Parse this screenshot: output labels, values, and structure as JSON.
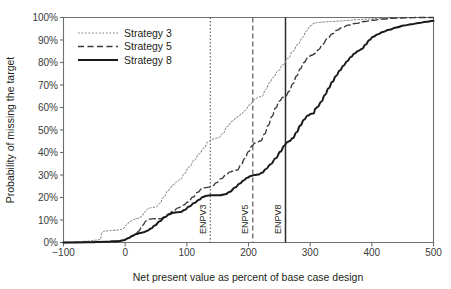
{
  "chart_data": {
    "type": "line",
    "title": "",
    "xlabel": "Net present value as percent of base case design",
    "ylabel": "Probability of missing the target",
    "xlim": [
      -100,
      500
    ],
    "ylim": [
      0,
      100
    ],
    "xticks": [
      -100,
      0,
      100,
      200,
      300,
      400,
      500
    ],
    "xtick_labels": [
      "−100",
      "0",
      "100",
      "200",
      "300",
      "400",
      "500"
    ],
    "yticks": [
      0,
      10,
      20,
      30,
      40,
      50,
      60,
      70,
      80,
      90,
      100
    ],
    "ytick_labels": [
      "0%",
      "10%",
      "20%",
      "30%",
      "40%",
      "50%",
      "60%",
      "70%",
      "80%",
      "90%",
      "100%"
    ],
    "grid": false,
    "legend_position": "top-left",
    "series": [
      {
        "name": "Strategy 3",
        "style": "dotted",
        "color": "#7a7a7a",
        "width": 1.0,
        "points": [
          [
            -100,
            0
          ],
          [
            -80,
            0.3
          ],
          [
            -60,
            0.6
          ],
          [
            -48,
            1.0
          ],
          [
            -40,
            1.3
          ],
          [
            -38,
            4.2
          ],
          [
            -34,
            5.0
          ],
          [
            -28,
            5.2
          ],
          [
            -20,
            5.4
          ],
          [
            -10,
            5.6
          ],
          [
            -4,
            6.0
          ],
          [
            2,
            7.8
          ],
          [
            8,
            9.4
          ],
          [
            14,
            10.2
          ],
          [
            20,
            10.7
          ],
          [
            26,
            11.4
          ],
          [
            32,
            13.6
          ],
          [
            38,
            15.2
          ],
          [
            44,
            15.6
          ],
          [
            50,
            15.8
          ],
          [
            56,
            17.4
          ],
          [
            62,
            20.0
          ],
          [
            70,
            23.2
          ],
          [
            78,
            25.6
          ],
          [
            84,
            27.0
          ],
          [
            90,
            28.2
          ],
          [
            96,
            30.6
          ],
          [
            104,
            33.6
          ],
          [
            112,
            36.6
          ],
          [
            120,
            39.4
          ],
          [
            128,
            42.0
          ],
          [
            134,
            44.6
          ],
          [
            140,
            45.8
          ],
          [
            146,
            46.2
          ],
          [
            152,
            46.6
          ],
          [
            158,
            48.4
          ],
          [
            166,
            51.6
          ],
          [
            174,
            54.0
          ],
          [
            182,
            55.8
          ],
          [
            188,
            57.0
          ],
          [
            194,
            58.6
          ],
          [
            202,
            61.2
          ],
          [
            210,
            63.6
          ],
          [
            216,
            64.6
          ],
          [
            222,
            65.0
          ],
          [
            228,
            68.0
          ],
          [
            234,
            71.0
          ],
          [
            240,
            73.4
          ],
          [
            248,
            76.2
          ],
          [
            256,
            79.0
          ],
          [
            264,
            81.8
          ],
          [
            272,
            85.0
          ],
          [
            280,
            88.0
          ],
          [
            288,
            91.2
          ],
          [
            294,
            94.0
          ],
          [
            300,
            96.2
          ],
          [
            306,
            97.4
          ],
          [
            312,
            97.8
          ],
          [
            322,
            98.0
          ],
          [
            334,
            98.2
          ],
          [
            346,
            98.4
          ],
          [
            360,
            98.7
          ],
          [
            376,
            99.0
          ],
          [
            392,
            99.3
          ],
          [
            410,
            99.6
          ],
          [
            430,
            99.8
          ],
          [
            450,
            100
          ],
          [
            470,
            100
          ],
          [
            500,
            100
          ]
        ]
      },
      {
        "name": "Strategy 5",
        "style": "dashed",
        "color": "#3a3a3a",
        "width": 1.4,
        "points": [
          [
            -100,
            0
          ],
          [
            -60,
            0.2
          ],
          [
            -30,
            0.4
          ],
          [
            -14,
            0.7
          ],
          [
            -4,
            1.0
          ],
          [
            4,
            1.8
          ],
          [
            10,
            2.6
          ],
          [
            16,
            3.4
          ],
          [
            22,
            5.0
          ],
          [
            28,
            7.6
          ],
          [
            34,
            9.6
          ],
          [
            40,
            10.4
          ],
          [
            46,
            10.6
          ],
          [
            52,
            10.5
          ],
          [
            58,
            10.6
          ],
          [
            64,
            11.4
          ],
          [
            70,
            12.6
          ],
          [
            78,
            14.0
          ],
          [
            86,
            15.4
          ],
          [
            94,
            16.6
          ],
          [
            102,
            18.0
          ],
          [
            110,
            20.2
          ],
          [
            118,
            22.4
          ],
          [
            124,
            23.8
          ],
          [
            130,
            24.4
          ],
          [
            136,
            24.6
          ],
          [
            142,
            25.2
          ],
          [
            148,
            26.6
          ],
          [
            156,
            28.4
          ],
          [
            164,
            30.2
          ],
          [
            170,
            31.4
          ],
          [
            176,
            31.8
          ],
          [
            182,
            32.2
          ],
          [
            188,
            34.6
          ],
          [
            194,
            37.4
          ],
          [
            200,
            40.4
          ],
          [
            206,
            43.0
          ],
          [
            210,
            44.2
          ],
          [
            214,
            44.6
          ],
          [
            220,
            45.2
          ],
          [
            226,
            48.2
          ],
          [
            232,
            52.0
          ],
          [
            238,
            56.0
          ],
          [
            244,
            59.8
          ],
          [
            250,
            62.8
          ],
          [
            256,
            64.6
          ],
          [
            260,
            65.0
          ],
          [
            266,
            67.2
          ],
          [
            272,
            70.6
          ],
          [
            278,
            74.0
          ],
          [
            284,
            77.2
          ],
          [
            290,
            80.0
          ],
          [
            296,
            82.0
          ],
          [
            302,
            83.2
          ],
          [
            308,
            84.0
          ],
          [
            314,
            85.8
          ],
          [
            320,
            88.0
          ],
          [
            328,
            90.6
          ],
          [
            336,
            92.8
          ],
          [
            344,
            94.4
          ],
          [
            352,
            95.6
          ],
          [
            362,
            96.6
          ],
          [
            374,
            97.4
          ],
          [
            388,
            98.2
          ],
          [
            402,
            98.8
          ],
          [
            418,
            99.3
          ],
          [
            436,
            99.7
          ],
          [
            456,
            99.9
          ],
          [
            478,
            100
          ],
          [
            500,
            100
          ]
        ]
      },
      {
        "name": "Strategy 8",
        "style": "solid",
        "color": "#1a1a1a",
        "width": 2.0,
        "points": [
          [
            -100,
            0
          ],
          [
            -60,
            0.1
          ],
          [
            -30,
            0.3
          ],
          [
            -16,
            0.5
          ],
          [
            -8,
            0.7
          ],
          [
            -2,
            1.0
          ],
          [
            6,
            2.0
          ],
          [
            12,
            3.0
          ],
          [
            18,
            3.8
          ],
          [
            24,
            4.2
          ],
          [
            30,
            4.6
          ],
          [
            36,
            5.2
          ],
          [
            42,
            6.2
          ],
          [
            48,
            7.6
          ],
          [
            56,
            9.4
          ],
          [
            64,
            11.2
          ],
          [
            72,
            12.6
          ],
          [
            78,
            13.2
          ],
          [
            84,
            13.4
          ],
          [
            90,
            13.6
          ],
          [
            96,
            14.4
          ],
          [
            104,
            16.0
          ],
          [
            112,
            17.6
          ],
          [
            120,
            19.0
          ],
          [
            126,
            20.2
          ],
          [
            132,
            20.8
          ],
          [
            138,
            21.0
          ],
          [
            146,
            21.0
          ],
          [
            154,
            21.0
          ],
          [
            162,
            21.4
          ],
          [
            170,
            22.6
          ],
          [
            178,
            24.4
          ],
          [
            186,
            26.2
          ],
          [
            192,
            27.6
          ],
          [
            198,
            28.8
          ],
          [
            204,
            29.6
          ],
          [
            210,
            30.0
          ],
          [
            216,
            30.2
          ],
          [
            222,
            31.0
          ],
          [
            228,
            32.6
          ],
          [
            236,
            34.8
          ],
          [
            244,
            37.4
          ],
          [
            252,
            40.4
          ],
          [
            258,
            43.0
          ],
          [
            262,
            44.4
          ],
          [
            266,
            45.0
          ],
          [
            272,
            46.4
          ],
          [
            278,
            49.0
          ],
          [
            284,
            52.0
          ],
          [
            290,
            54.6
          ],
          [
            296,
            56.4
          ],
          [
            302,
            57.2
          ],
          [
            306,
            57.4
          ],
          [
            308,
            59.4
          ],
          [
            312,
            60.2
          ],
          [
            318,
            62.6
          ],
          [
            324,
            65.6
          ],
          [
            330,
            68.6
          ],
          [
            336,
            71.4
          ],
          [
            342,
            74.0
          ],
          [
            348,
            76.4
          ],
          [
            354,
            78.6
          ],
          [
            360,
            80.6
          ],
          [
            366,
            82.4
          ],
          [
            372,
            84.0
          ],
          [
            378,
            85.2
          ],
          [
            384,
            86.0
          ],
          [
            390,
            88.0
          ],
          [
            396,
            90.0
          ],
          [
            402,
            91.4
          ],
          [
            410,
            92.6
          ],
          [
            418,
            93.6
          ],
          [
            428,
            94.6
          ],
          [
            440,
            95.6
          ],
          [
            452,
            96.4
          ],
          [
            464,
            97.0
          ],
          [
            476,
            97.6
          ],
          [
            488,
            98.1
          ],
          [
            500,
            98.6
          ]
        ]
      }
    ],
    "vertical_lines": [
      {
        "label": "ENPV3",
        "x": 138,
        "style": "dotted",
        "color": "#4a4a4a",
        "width": 1.0
      },
      {
        "label": "ENPV5",
        "x": 207,
        "style": "dashed",
        "color": "#4a4a4a",
        "width": 1.1
      },
      {
        "label": "ENPV8",
        "x": 260,
        "style": "solid",
        "color": "#2a2a2a",
        "width": 1.5
      }
    ]
  },
  "legend": {
    "items": [
      {
        "label": "Strategy 3"
      },
      {
        "label": "Strategy 5"
      },
      {
        "label": "Strategy 8"
      }
    ]
  }
}
